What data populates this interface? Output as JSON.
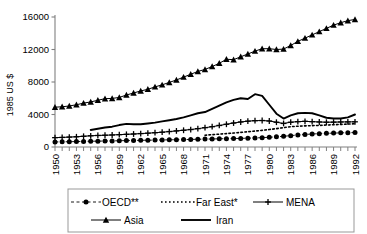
{
  "chart_data": {
    "type": "line",
    "title": "",
    "xlabel": "",
    "ylabel": "1985 US $",
    "ylim": [
      0,
      16000
    ],
    "xlim": [
      1950,
      1992
    ],
    "ytick_labels": [
      "0",
      "4000",
      "8000",
      "12000",
      "16000"
    ],
    "ytick_values": [
      0,
      4000,
      8000,
      12000,
      16000
    ],
    "xtick_labels": [
      "1950",
      "1953",
      "1956",
      "1959",
      "1962",
      "1965",
      "1968",
      "1971",
      "1974",
      "1977",
      "1980",
      "1983",
      "1986",
      "1989",
      "1992"
    ],
    "xtick_values": [
      1950,
      1953,
      1956,
      1959,
      1962,
      1965,
      1968,
      1971,
      1974,
      1977,
      1980,
      1983,
      1986,
      1989,
      1992
    ],
    "x_all_years": [
      1950,
      1951,
      1952,
      1953,
      1954,
      1955,
      1956,
      1957,
      1958,
      1959,
      1960,
      1961,
      1962,
      1963,
      1964,
      1965,
      1966,
      1967,
      1968,
      1969,
      1970,
      1971,
      1972,
      1973,
      1974,
      1975,
      1976,
      1977,
      1978,
      1979,
      1980,
      1981,
      1982,
      1983,
      1984,
      1985,
      1986,
      1987,
      1988,
      1989,
      1990,
      1991,
      1992
    ],
    "grid": false,
    "legend_position": "bottom",
    "series": [
      {
        "name": "OECD**",
        "marker": "filled-circle",
        "line_style": "dashed",
        "x": [
          1950,
          1951,
          1952,
          1953,
          1954,
          1955,
          1956,
          1957,
          1958,
          1959,
          1960,
          1961,
          1962,
          1963,
          1964,
          1965,
          1966,
          1967,
          1968,
          1969,
          1970,
          1971,
          1972,
          1973,
          1974,
          1975,
          1976,
          1977,
          1978,
          1979,
          1980,
          1981,
          1982,
          1983,
          1984,
          1985,
          1986,
          1987,
          1988,
          1989,
          1990,
          1991,
          1992
        ],
        "values": [
          620,
          640,
          650,
          670,
          690,
          710,
          720,
          740,
          750,
          770,
          790,
          800,
          820,
          840,
          850,
          870,
          880,
          900,
          910,
          930,
          950,
          970,
          990,
          1010,
          1030,
          1040,
          1060,
          1090,
          1120,
          1150,
          1200,
          1250,
          1320,
          1400,
          1480,
          1540,
          1600,
          1640,
          1680,
          1710,
          1740,
          1760,
          1780
        ]
      },
      {
        "name": "Far East*",
        "marker": "none",
        "line_style": "dotted",
        "x": [
          1971,
          1972,
          1973,
          1974,
          1975,
          1976,
          1977,
          1978,
          1979,
          1980,
          1981,
          1982,
          1983,
          1984,
          1985,
          1986,
          1987,
          1988,
          1989,
          1990,
          1991,
          1992
        ],
        "values": [
          1450,
          1520,
          1580,
          1650,
          1720,
          1800,
          1880,
          1960,
          2050,
          2150,
          2260,
          2380,
          2500,
          2560,
          2600,
          2630,
          2660,
          2700,
          2740,
          2780,
          2820,
          2860
        ]
      },
      {
        "name": "MENA",
        "marker": "plus",
        "line_style": "solid-thin",
        "x": [
          1950,
          1951,
          1952,
          1953,
          1954,
          1955,
          1956,
          1957,
          1958,
          1959,
          1960,
          1961,
          1962,
          1963,
          1964,
          1965,
          1966,
          1967,
          1968,
          1969,
          1970,
          1971,
          1972,
          1973,
          1974,
          1975,
          1976,
          1977,
          1978,
          1979,
          1980,
          1981,
          1982,
          1983,
          1984,
          1985,
          1986,
          1987,
          1988,
          1989,
          1990,
          1991,
          1992
        ],
        "values": [
          1150,
          1180,
          1220,
          1260,
          1320,
          1380,
          1420,
          1450,
          1480,
          1520,
          1560,
          1600,
          1650,
          1700,
          1760,
          1820,
          1900,
          1980,
          2060,
          2150,
          2260,
          2380,
          2500,
          2650,
          2800,
          2950,
          3080,
          3180,
          3240,
          3260,
          3200,
          3050,
          2900,
          3050,
          3120,
          3160,
          3120,
          3080,
          3050,
          3060,
          3080,
          3090,
          3100
        ]
      },
      {
        "name": "Asia",
        "marker": "filled-triangle",
        "line_style": "solid-thin",
        "x": [
          1950,
          1951,
          1952,
          1953,
          1954,
          1955,
          1956,
          1957,
          1958,
          1959,
          1960,
          1961,
          1962,
          1963,
          1964,
          1965,
          1966,
          1967,
          1968,
          1969,
          1970,
          1971,
          1972,
          1973,
          1974,
          1975,
          1976,
          1977,
          1978,
          1979,
          1980,
          1981,
          1982,
          1983,
          1984,
          1985,
          1986,
          1987,
          1988,
          1989,
          1990,
          1991,
          1992
        ],
        "values": [
          4900,
          4950,
          5050,
          5200,
          5400,
          5550,
          5750,
          5950,
          5980,
          6100,
          6400,
          6650,
          6900,
          7100,
          7400,
          7650,
          7950,
          8250,
          8600,
          8950,
          9300,
          9550,
          9900,
          10300,
          10800,
          10750,
          11100,
          11450,
          11800,
          12100,
          12100,
          12000,
          12050,
          12500,
          13000,
          13400,
          13800,
          14200,
          14600,
          15000,
          15300,
          15550,
          15700
        ]
      },
      {
        "name": "Iran",
        "marker": "none",
        "line_style": "solid-thick",
        "x": [
          1955,
          1956,
          1957,
          1958,
          1959,
          1960,
          1961,
          1962,
          1963,
          1964,
          1965,
          1966,
          1967,
          1968,
          1969,
          1970,
          1971,
          1972,
          1973,
          1974,
          1975,
          1976,
          1977,
          1978,
          1979,
          1980,
          1981,
          1982,
          1983,
          1984,
          1985,
          1986,
          1987,
          1988,
          1989,
          1990,
          1991,
          1992
        ],
        "values": [
          2100,
          2250,
          2400,
          2500,
          2700,
          2850,
          2800,
          2800,
          2900,
          3000,
          3150,
          3300,
          3450,
          3650,
          3900,
          4150,
          4300,
          4700,
          5100,
          5500,
          5800,
          6000,
          5900,
          6500,
          6300,
          5200,
          4100,
          3500,
          3900,
          4150,
          4200,
          4150,
          3900,
          3600,
          3500,
          3500,
          3650,
          4000
        ]
      }
    ]
  },
  "legend": {
    "items": [
      {
        "label": "OECD**",
        "marker": "filled-circle",
        "line": "dashed"
      },
      {
        "label": "Far East*",
        "marker": "none",
        "line": "dotted"
      },
      {
        "label": "MENA",
        "marker": "plus",
        "line": "solid"
      },
      {
        "label": "Asia",
        "marker": "filled-triangle",
        "line": "solid"
      },
      {
        "label": "Iran",
        "marker": "none",
        "line": "solid-thick"
      }
    ]
  },
  "colors": {
    "ink": "#000000",
    "axis": "#808080",
    "background": "#ffffff",
    "legend_border": "#999999"
  }
}
